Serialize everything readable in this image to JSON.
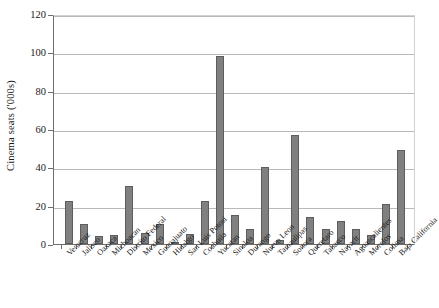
{
  "chart_data": {
    "type": "bar",
    "title": "",
    "xlabel": "",
    "ylabel": "Cinema seats ('000s)",
    "ylim": [
      0,
      120
    ],
    "yticks": [
      0,
      20,
      40,
      60,
      80,
      100,
      120
    ],
    "grid": true,
    "legend": "none",
    "bar_color": "#808080",
    "bar_edge_color": "#5d5d5d",
    "categories": [
      "Veracruz",
      "Jalisco",
      "Oaxaca",
      "Michoacan",
      "Distrito Federal",
      "Mexico",
      "Guanajuato",
      "Hidalgo",
      "San Luis Potosi",
      "Coahuila",
      "Yucatan",
      "Sinaloa",
      "Durango",
      "Nuevo Leon",
      "Tamaulipas",
      "Sonora",
      "Queretaro",
      "Tabasco",
      "Nayarit",
      "Aguascalientes",
      "Morelos",
      "Colima",
      "Baja California"
    ],
    "values": [
      22.5,
      10.5,
      4,
      4.5,
      30.5,
      6,
      10.5,
      1,
      5,
      22.5,
      98,
      15,
      8,
      40,
      2,
      57,
      14,
      8,
      12,
      8,
      4.5,
      21,
      49
    ]
  }
}
